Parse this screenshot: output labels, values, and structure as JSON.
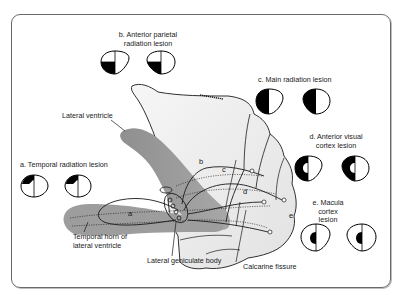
{
  "figure": {
    "title_labels": {
      "a": "a. Temporal radiation lesion",
      "b_line1": "b. Anterior parietal",
      "b_line2": "radiation lesion",
      "c": "c. Main radiation lesion",
      "d_line1": "d. Anterior visual",
      "d_line2": "cortex lesion",
      "e_line1": "e. Macula",
      "e_line2": "cortex",
      "e_line3": "lesion"
    },
    "anatomy_labels": {
      "lateral_ventricle": "Lateral ventricle",
      "temporal_horn_line1": "Temporal horn of",
      "temporal_horn_line2": "lateral ventricle",
      "lateral_geniculate_body": "Lateral geniculate body",
      "calcarine_fissure": "Calcarine fissure"
    },
    "pathway_letters": {
      "a": "a",
      "b": "b",
      "c": "c",
      "d": "d",
      "e": "e"
    },
    "visual_field_defects": [
      {
        "lesion": "a",
        "description": "Superior quadrant defect (pie-in-the-sky), left eye field",
        "eye": "left"
      },
      {
        "lesion": "a",
        "description": "Superior quadrant defect, right eye field",
        "eye": "right"
      },
      {
        "lesion": "b",
        "description": "Inferior quadrantanopia, left eye field",
        "eye": "left"
      },
      {
        "lesion": "b",
        "description": "Inferior quadrantanopia, right eye field",
        "eye": "right"
      },
      {
        "lesion": "c",
        "description": "Homonymous hemianopia, left eye field",
        "eye": "left"
      },
      {
        "lesion": "c",
        "description": "Homonymous hemianopia, right eye field",
        "eye": "right"
      },
      {
        "lesion": "d",
        "description": "Hemianopia with macular sparing, left eye field",
        "eye": "left"
      },
      {
        "lesion": "d",
        "description": "Hemianopia with macular sparing, right eye field",
        "eye": "right"
      },
      {
        "lesion": "e",
        "description": "Central homonymous scotoma, left eye field",
        "eye": "left"
      },
      {
        "lesion": "e",
        "description": "Central homonymous scotoma, right eye field",
        "eye": "right"
      }
    ],
    "colors": {
      "ventricle_fill": "#9a9a9a",
      "brain_fill": "#ececec",
      "outline": "#1a1a1a",
      "defect_fill": "#000000"
    }
  }
}
